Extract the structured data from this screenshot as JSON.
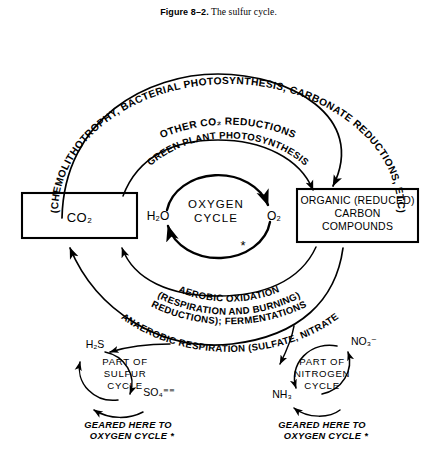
{
  "figure": {
    "caption_label": "Figure 8–2.",
    "caption_text": "The sulfur cycle."
  },
  "boxes": {
    "co2": {
      "label": "CO₂"
    },
    "organic": {
      "line1": "ORGANIC (REDUCED)",
      "line2": "CARBON",
      "line3": "COMPOUNDS"
    }
  },
  "center_cycle": {
    "line1": "OXYGEN",
    "line2": "CYCLE",
    "left_species": "H₂O",
    "right_species": "O₂",
    "asterisk": "*"
  },
  "arcs": {
    "outer_top_left": "(CHEMOLITHOTROPHY, BACTERIAL PHOTOSYNTHESIS, CARBONATE REDUCTIONS, ETC)",
    "outer_top_second": "OTHER CO₂ REDUCTIONS",
    "inner_top": "GREEN PLANT PHOTOSYNTHESIS",
    "inner_bottom_line1": "AEROBIC OXIDATION",
    "inner_bottom_line2": "(RESPIRATION AND BURNING)",
    "outer_bottom_line1": "ANAEROBIC RESPIRATION (SULFATE, NITRATE",
    "outer_bottom_line2": "REDUCTIONS); FERMENTATIONS"
  },
  "sulfur_cycle": {
    "line1": "PART OF",
    "line2": "SULFUR",
    "line3": "CYCLE",
    "top_species": "H₂S",
    "bottom_species": "SO₄⁼⁼",
    "geared_line1": "GEARED HERE TO",
    "geared_line2": "OXYGEN CYCLE *"
  },
  "nitrogen_cycle": {
    "line1": "PART OF",
    "line2": "NITROGEN",
    "line3": "CYCLE",
    "top_species": "NO₃⁻",
    "bottom_species": "NH₃",
    "geared_line1": "GEARED HERE TO",
    "geared_line2": "OXYGEN CYCLE *"
  },
  "colors": {
    "ink": "#000000",
    "paper": "#ffffff"
  }
}
